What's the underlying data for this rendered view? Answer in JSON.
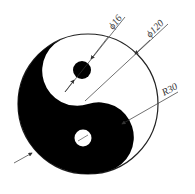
{
  "diagram": {
    "type": "dimensioned yin-yang drawing",
    "colors": {
      "ink": "#000000",
      "paper": "#ffffff",
      "dim_line": "#333333"
    },
    "dimensions": [
      {
        "id": "small-circle-diameter",
        "label": "ϕ16"
      },
      {
        "id": "outer-diameter",
        "label": "ϕ120"
      },
      {
        "id": "inner-arc-radius",
        "label": "R30"
      }
    ]
  }
}
